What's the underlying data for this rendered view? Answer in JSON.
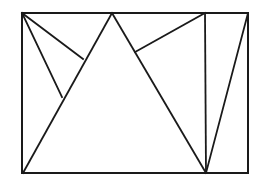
{
  "figure": {
    "title": "Rectangle subdivided by triangles",
    "background_color": "#ffffff",
    "stroke_color": "#1a1a1a",
    "canvas": {
      "width": 261,
      "height": 190
    },
    "bounds": {
      "left": 22,
      "top": 13,
      "right": 248,
      "bottom": 173
    },
    "stroke_widths": {
      "outline": 2.0,
      "interior": 1.8
    },
    "vertices": {
      "rect_top_left": {
        "x": 22,
        "y": 13
      },
      "rect_top_right": {
        "x": 248,
        "y": 13
      },
      "rect_bottom_right": {
        "x": 248,
        "y": 173
      },
      "rect_bottom_left": {
        "x": 22,
        "y": 173
      },
      "apex_top": {
        "x": 112,
        "y": 13
      },
      "vertical_top": {
        "x": 205,
        "y": 13
      },
      "base_junction": {
        "x": 206,
        "y": 173
      },
      "left_upper_junction": {
        "x": 83,
        "y": 59
      },
      "left_lower_junction": {
        "x": 62,
        "y": 97
      },
      "right_junction": {
        "x": 135,
        "y": 52
      },
      "triangle_base_left": {
        "x": 23,
        "y": 173
      }
    },
    "segments": [
      {
        "name": "rect-top-edge",
        "x1": 22,
        "y1": 13,
        "x2": 248,
        "y2": 13,
        "role": "outline"
      },
      {
        "name": "rect-right-edge",
        "x1": 248,
        "y1": 13,
        "x2": 248,
        "y2": 173,
        "role": "outline"
      },
      {
        "name": "rect-bottom-edge",
        "x1": 248,
        "y1": 173,
        "x2": 22,
        "y2": 173,
        "role": "outline"
      },
      {
        "name": "rect-left-edge",
        "x1": 22,
        "y1": 173,
        "x2": 22,
        "y2": 13,
        "role": "outline"
      },
      {
        "name": "central-triangle-left-edge",
        "x1": 112,
        "y1": 13,
        "x2": 23,
        "y2": 173,
        "role": "interior"
      },
      {
        "name": "central-triangle-right-edge",
        "x1": 112,
        "y1": 13,
        "x2": 206,
        "y2": 173,
        "role": "interior"
      },
      {
        "name": "corner-to-left-upper-junction",
        "x1": 22,
        "y1": 13,
        "x2": 83,
        "y2": 59,
        "role": "interior"
      },
      {
        "name": "corner-to-left-lower-junction",
        "x1": 22,
        "y1": 13,
        "x2": 62,
        "y2": 97,
        "role": "interior"
      },
      {
        "name": "vertical-divider",
        "x1": 205,
        "y1": 13,
        "x2": 206,
        "y2": 173,
        "role": "interior"
      },
      {
        "name": "top-right-corner-to-right-junction",
        "x1": 205,
        "y1": 13,
        "x2": 135,
        "y2": 52,
        "role": "interior"
      },
      {
        "name": "top-right-corner-to-base-junction",
        "x1": 248,
        "y1": 13,
        "x2": 206,
        "y2": 173,
        "role": "interior"
      }
    ]
  }
}
